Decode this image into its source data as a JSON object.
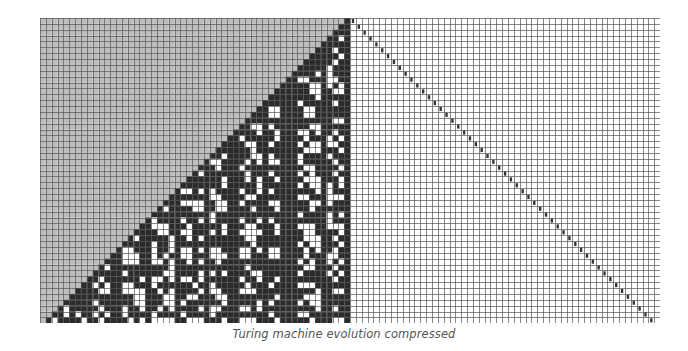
{
  "figure": {
    "caption": "Turing machine evolution compressed",
    "rows": 52,
    "left_cols": 53,
    "right_cols": 53,
    "cell_width": 5.85,
    "cell_height": 5.87,
    "colors": {
      "unvisited": "#bdbdbd",
      "black": "#2b2b2b",
      "white": "#ffffff",
      "grid_line": "#555555",
      "head_marker": "#333333"
    },
    "left_panel": {
      "description": "compressed tape evolution: gray upper-left triangle, black/white cell pattern in lower triangle",
      "boundary_column_black": true
    },
    "right_panel": {
      "description": "white grid with head-position markers along the diagonal",
      "head_path": "diagonal, one column right per row"
    }
  }
}
